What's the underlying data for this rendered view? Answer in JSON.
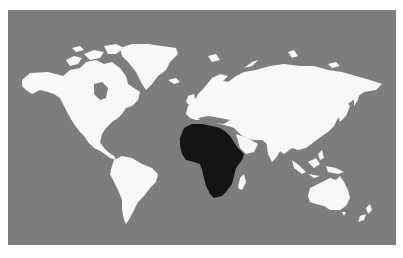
{
  "map": {
    "type": "world-map",
    "projection": "equirectangular-like",
    "colors": {
      "background_page": "#ffffff",
      "ocean": "#7d7d7d",
      "land": "#f8f8f8",
      "highlight": "#141414"
    },
    "highlighted_region": "Africa",
    "regions": [
      {
        "name": "North America",
        "highlighted": false
      },
      {
        "name": "Greenland",
        "highlighted": false
      },
      {
        "name": "South America",
        "highlighted": false
      },
      {
        "name": "Europe",
        "highlighted": false
      },
      {
        "name": "Asia",
        "highlighted": false
      },
      {
        "name": "Africa",
        "highlighted": true
      },
      {
        "name": "Madagascar",
        "highlighted": false
      },
      {
        "name": "Australia",
        "highlighted": false
      },
      {
        "name": "New Zealand",
        "highlighted": false
      },
      {
        "name": "Iceland",
        "highlighted": false
      },
      {
        "name": "British Isles",
        "highlighted": false
      },
      {
        "name": "Japan",
        "highlighted": false
      },
      {
        "name": "Southeast Asia Islands",
        "highlighted": false
      }
    ]
  }
}
